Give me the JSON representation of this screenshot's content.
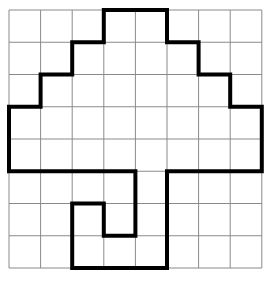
{
  "diagram": {
    "type": "grid-polyomino-outline",
    "grid": {
      "columns": 8,
      "rows": 8,
      "origin": [
        9,
        10
      ],
      "cell_width": 31.6,
      "cell_height": 32.25,
      "line_color": "#8a8a8a",
      "line_width": 1
    },
    "outline": {
      "color": "#000000",
      "stroke_width": 4,
      "vertices_grid": [
        [
          3,
          0
        ],
        [
          5,
          0
        ],
        [
          5,
          1
        ],
        [
          6,
          1
        ],
        [
          6,
          2
        ],
        [
          7,
          2
        ],
        [
          7,
          3
        ],
        [
          8,
          3
        ],
        [
          8,
          5
        ],
        [
          5,
          5
        ],
        [
          5,
          8
        ],
        [
          2,
          8
        ],
        [
          2,
          6
        ],
        [
          3,
          6
        ],
        [
          3,
          7
        ],
        [
          4,
          7
        ],
        [
          4,
          5
        ],
        [
          0,
          5
        ],
        [
          0,
          3
        ],
        [
          1,
          3
        ],
        [
          1,
          2
        ],
        [
          2,
          2
        ],
        [
          2,
          1
        ],
        [
          3,
          1
        ]
      ]
    },
    "background": "#ffffff"
  }
}
